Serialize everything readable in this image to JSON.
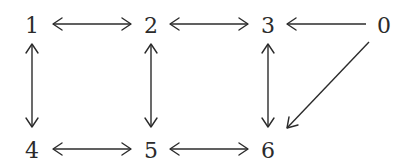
{
  "diagram": {
    "type": "directed-graph",
    "nodes": [
      {
        "id": "0",
        "label": "0",
        "x": 384,
        "y": 25
      },
      {
        "id": "1",
        "label": "1",
        "x": 32,
        "y": 25
      },
      {
        "id": "2",
        "label": "2",
        "x": 151,
        "y": 25
      },
      {
        "id": "3",
        "label": "3",
        "x": 268,
        "y": 25
      },
      {
        "id": "4",
        "label": "4",
        "x": 32,
        "y": 150
      },
      {
        "id": "5",
        "label": "5",
        "x": 151,
        "y": 150
      },
      {
        "id": "6",
        "label": "6",
        "x": 268,
        "y": 150
      }
    ],
    "edges": [
      {
        "from": "1",
        "to": "2",
        "bidirectional": true
      },
      {
        "from": "2",
        "to": "3",
        "bidirectional": true
      },
      {
        "from": "0",
        "to": "3",
        "bidirectional": false
      },
      {
        "from": "1",
        "to": "4",
        "bidirectional": true
      },
      {
        "from": "2",
        "to": "5",
        "bidirectional": true
      },
      {
        "from": "3",
        "to": "6",
        "bidirectional": true
      },
      {
        "from": "4",
        "to": "5",
        "bidirectional": true
      },
      {
        "from": "5",
        "to": "6",
        "bidirectional": true
      },
      {
        "from": "0",
        "to": "6",
        "bidirectional": false
      }
    ],
    "colors": {
      "ink": "#2b2b2b",
      "background": "#ffffff"
    }
  }
}
